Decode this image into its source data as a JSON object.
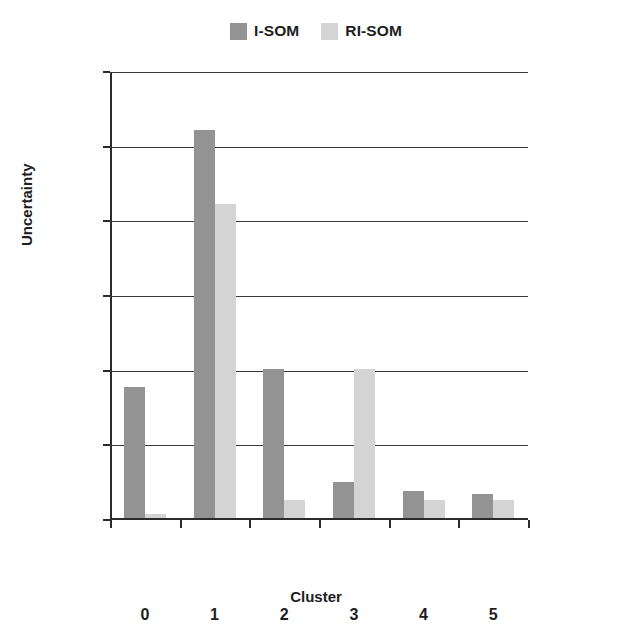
{
  "chart_data": {
    "type": "bar",
    "title": "",
    "subtitle": "",
    "xlabel": "Cluster",
    "ylabel": "Uncertainty",
    "categories": [
      "0",
      "1",
      "2",
      "3",
      "4",
      "5"
    ],
    "series": [
      {
        "name": "I-SOM",
        "values": [
          0.0088,
          0.026,
          0.01,
          0.0024,
          0.0018,
          0.0016
        ],
        "color": "#939393"
      },
      {
        "name": "RI-SOM",
        "values": [
          0.0003,
          0.021,
          0.0012,
          0.01,
          0.0012,
          0.0012
        ],
        "color": "#d4d4d4"
      }
    ],
    "ylim": [
      0,
      0.03
    ],
    "ytick_labels": [
      "0",
      "0.005",
      "0.01",
      "0.015",
      "0.02",
      "0.025",
      "0.03"
    ],
    "ytick_values": [
      0,
      0.005,
      0.01,
      0.015,
      0.02,
      0.025,
      0.03
    ],
    "grid": true,
    "grid_axis": "y",
    "legend_position": "top-center",
    "legend": [
      "I-SOM",
      "RI-SOM"
    ],
    "background_color": "#ffffff",
    "axis_color": "#2b2b2b"
  }
}
